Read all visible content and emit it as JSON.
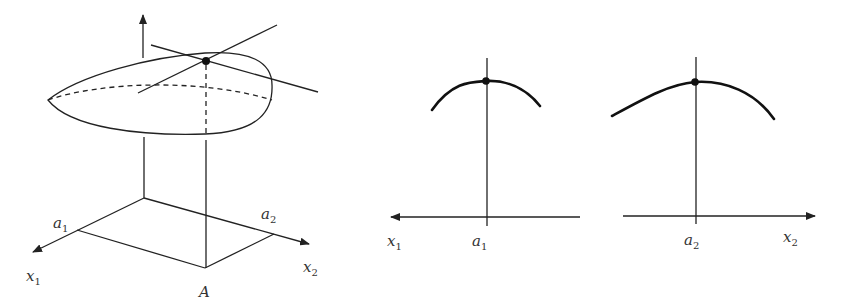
{
  "figure": {
    "colors": {
      "stroke": "#222222",
      "curve": "#111111",
      "label": "#333333",
      "background": "#ffffff"
    },
    "left_panel": {
      "description": "3D surface over (x1, x2) plane with maximum point above A and two tangent lines",
      "labels": {
        "a1": {
          "base": "a",
          "sub": "1"
        },
        "a2": {
          "base": "a",
          "sub": "2"
        },
        "x1": {
          "base": "x",
          "sub": "1"
        },
        "x2": {
          "base": "x",
          "sub": "2"
        },
        "A": "A"
      },
      "icons": [
        "vertical-axis-arrow",
        "x1-axis-arrow",
        "x2-axis-arrow",
        "max-point-dot"
      ]
    },
    "middle_panel": {
      "description": "cross-section along x1 with peak at a1",
      "labels": {
        "x1": {
          "base": "x",
          "sub": "1"
        },
        "a1": {
          "base": "a",
          "sub": "1"
        }
      },
      "axis_direction": "left"
    },
    "right_panel": {
      "description": "cross-section along x2 with peak at a2",
      "labels": {
        "a2": {
          "base": "a",
          "sub": "2"
        },
        "x2": {
          "base": "x",
          "sub": "2"
        }
      },
      "axis_direction": "right"
    }
  }
}
